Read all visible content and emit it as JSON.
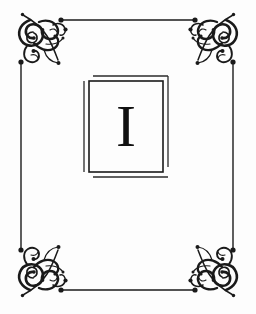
{
  "page": {
    "kind": "decorative-title-plate",
    "background_color": "#fdfdfd",
    "ink_color": "#111111",
    "width": 256,
    "height": 314
  },
  "border": {
    "name": "ornamental-rule-frame",
    "line_color": "#1a1a1a",
    "top_rule_y": 20,
    "bottom_rule_y": 290,
    "left_rule_x": 21,
    "right_rule_x": 233,
    "terminal_shape": "ball-and-dot",
    "terminals_count": 8
  },
  "corners": [
    {
      "name": "corner-flourish-top-left",
      "position": "top-left",
      "style": "victorian-scroll"
    },
    {
      "name": "corner-flourish-top-right",
      "position": "top-right",
      "style": "victorian-scroll"
    },
    {
      "name": "corner-flourish-bottom-left",
      "position": "bottom-left",
      "style": "victorian-scroll"
    },
    {
      "name": "corner-flourish-bottom-right",
      "position": "bottom-right",
      "style": "victorian-scroll"
    }
  ],
  "plate": {
    "name": "initial-letter-panel",
    "outline_style": "double-offset-rule",
    "box": {
      "x": 89,
      "y": 81,
      "width": 74,
      "height": 91
    },
    "offset_rule": {
      "dx": 5,
      "dy": -5
    },
    "letter": "I",
    "letter_style": "roman-serif-capital"
  }
}
